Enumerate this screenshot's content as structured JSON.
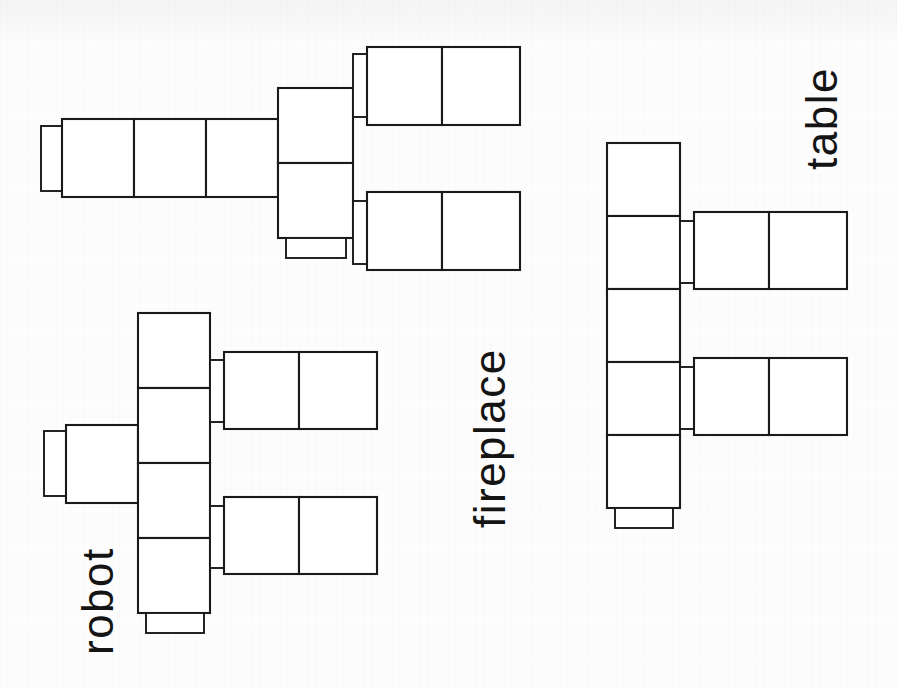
{
  "page": {
    "width": 897,
    "height": 688,
    "background_color": "#fdfdfd",
    "ink_color": "#1a1a1a"
  },
  "figures": [
    {
      "id": "fireplace",
      "label": "fireplace",
      "label_rotation_deg": -90,
      "orientation": "horizontal",
      "spine_cells": 3,
      "arms": 2,
      "arm_cells": 2,
      "has_end_cap": true,
      "has_foot": true
    },
    {
      "id": "robot",
      "label": "robot",
      "label_rotation_deg": -90,
      "orientation": "vertical",
      "spine_cells": 4,
      "arms": 2,
      "arm_cells": 2,
      "has_end_cap": true,
      "has_foot": true
    },
    {
      "id": "table",
      "label": "table",
      "label_rotation_deg": -90,
      "orientation": "vertical",
      "spine_cells": 5,
      "arms": 2,
      "arm_cells": 2,
      "has_end_cap": false,
      "has_foot": true
    }
  ],
  "labels": {
    "fireplace": "fireplace",
    "robot": "robot",
    "table": "table"
  }
}
